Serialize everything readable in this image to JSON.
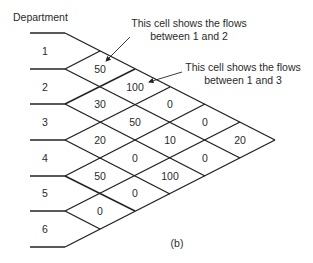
{
  "diagram": {
    "header": "Department",
    "caption": "(b)",
    "departments": [
      "1",
      "2",
      "3",
      "4",
      "5",
      "6"
    ],
    "cells": [
      {
        "pair": "1-2",
        "value": "50"
      },
      {
        "pair": "2-3",
        "value": "30"
      },
      {
        "pair": "3-4",
        "value": "20"
      },
      {
        "pair": "4-5",
        "value": "50"
      },
      {
        "pair": "5-6",
        "value": "0"
      },
      {
        "pair": "1-3",
        "value": "100"
      },
      {
        "pair": "2-4",
        "value": "50"
      },
      {
        "pair": "3-5",
        "value": "0"
      },
      {
        "pair": "4-6",
        "value": "0"
      },
      {
        "pair": "1-4",
        "value": "0"
      },
      {
        "pair": "2-5",
        "value": "10"
      },
      {
        "pair": "3-6",
        "value": "100"
      },
      {
        "pair": "1-5",
        "value": "0"
      },
      {
        "pair": "2-6",
        "value": "0"
      },
      {
        "pair": "1-6",
        "value": "20"
      }
    ],
    "annotations": [
      {
        "line1": "This cell shows the flows",
        "line2": "between 1 and 2",
        "target": "1-2"
      },
      {
        "line1": "This cell shows the flows",
        "line2": "between 1 and 3",
        "target": "1-3"
      }
    ]
  },
  "colors": {
    "line": "#222222",
    "text": "#2a2a2a",
    "background": "#ffffff"
  }
}
